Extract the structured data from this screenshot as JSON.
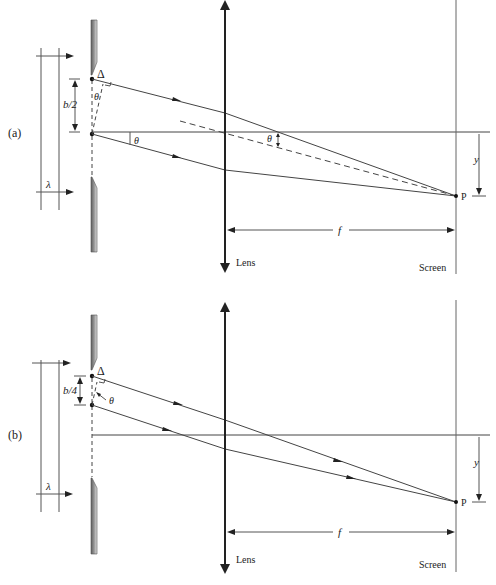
{
  "figure": {
    "panels": [
      {
        "id": "a",
        "label": "(a)",
        "slit_separation_label": "b/2",
        "path_difference_label": "Δ",
        "angle_label_slit": "θ",
        "angle_label_ray": "θ",
        "angle_label_lens": "θ",
        "wavelength_label": "λ",
        "focal_label": "f",
        "offset_label": "y",
        "point_label": "P",
        "lens_label": "Lens",
        "screen_label": "Screen"
      },
      {
        "id": "b",
        "label": "(b)",
        "slit_separation_label": "b/4",
        "path_difference_label": "Δ",
        "angle_label_slit": "θ",
        "wavelength_label": "λ",
        "focal_label": "f",
        "offset_label": "y",
        "point_label": "P",
        "lens_label": "Lens",
        "screen_label": "Screen"
      }
    ],
    "colors": {
      "line": "#444444",
      "lens": "#222222",
      "barrier_dark": "#6a6a6a",
      "barrier_light": "#d6d6d6",
      "background": "#ffffff"
    }
  }
}
